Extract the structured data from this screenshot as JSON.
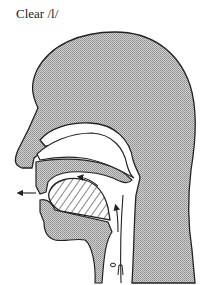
{
  "title": "Clear /l/",
  "diagram": {
    "type": "midsagittal vocal tract cross-section",
    "labels": [
      "Clear /l/"
    ],
    "elements": [
      "head-profile",
      "nasal-cavity",
      "hard-palate",
      "tongue-hatched",
      "lower-jaw",
      "pharynx",
      "airflow-arrow-out-of-mouth",
      "airflow-arrow-over-tongue",
      "airflow-arrow-up-pharynx"
    ],
    "colors": {
      "fill": "#b8b8b8",
      "stroke": "#222222",
      "background": "#ffffff"
    }
  }
}
